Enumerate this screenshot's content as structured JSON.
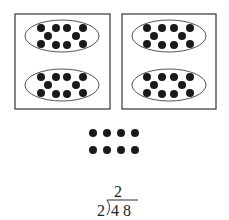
{
  "diagram": {
    "groups": [
      {
        "label": "group-1",
        "ellipses": [
          {
            "dots": 10
          },
          {
            "dots": 10
          }
        ]
      },
      {
        "label": "group-2",
        "ellipses": [
          {
            "dots": 10
          },
          {
            "dots": 10
          }
        ]
      }
    ],
    "remaining_ones": {
      "rows": 2,
      "cols": 4,
      "count": 8
    },
    "long_division": {
      "divisor": "2",
      "dividend": "4 8",
      "quotient": "2"
    }
  },
  "colors": {
    "dot": "#1a1a1a",
    "stroke": "#333333",
    "background": "#ffffff"
  }
}
